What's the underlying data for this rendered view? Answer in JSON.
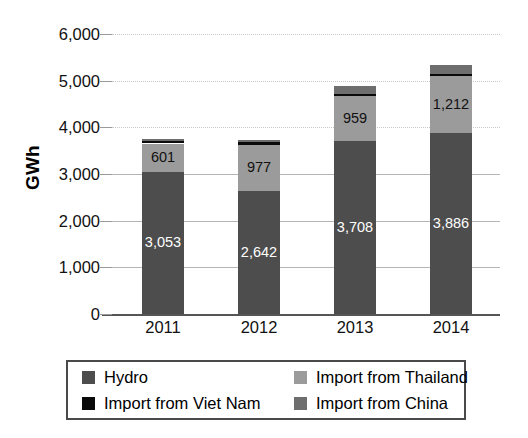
{
  "chart_data": {
    "type": "bar",
    "subtype": "stacked-column",
    "title": "",
    "xlabel": "",
    "ylabel": "GWh",
    "ylim": [
      0,
      6000
    ],
    "ytick_step": 1000,
    "ytick_labels": [
      "6,000",
      "5,000",
      "4,000",
      "3,000",
      "2,000",
      "1,000",
      "0"
    ],
    "ytick_values": [
      6000,
      5000,
      4000,
      3000,
      2000,
      1000,
      0
    ],
    "grid": true,
    "legend_position": "bottom",
    "categories": [
      "2011",
      "2012",
      "2013",
      "2014"
    ],
    "series": [
      {
        "name": "Hydro",
        "color": "#4d4d4d",
        "values": [
          3053,
          2642,
          3708,
          3886
        ],
        "labels": [
          "3,053",
          "2,642",
          "3,708",
          "3,886"
        ]
      },
      {
        "name": "Import from Thailand",
        "color": "#9b9b9b",
        "values": [
          601,
          977,
          959,
          1212
        ],
        "labels": [
          "601",
          "977",
          "959",
          "1,212"
        ]
      },
      {
        "name": "Import from Viet Nam",
        "color": "#0a0a0a",
        "values": [
          60,
          60,
          55,
          55
        ],
        "labels": [
          "",
          "",
          "",
          ""
        ]
      },
      {
        "name": "Import from China",
        "color": "#6e6e6e",
        "values": [
          45,
          60,
          170,
          180
        ],
        "labels": [
          "",
          "",
          "",
          ""
        ]
      }
    ],
    "totals": [
      3759,
      3739,
      4892,
      5333
    ]
  },
  "legend": {
    "items": [
      {
        "label": "Hydro",
        "color": "#4d4d4d",
        "swatch": "hydro"
      },
      {
        "label": "Import from Thailand",
        "color": "#9b9b9b",
        "swatch": "thailand"
      },
      {
        "label": "Import from Viet Nam",
        "color": "#0a0a0a",
        "swatch": "vietnam"
      },
      {
        "label": "Import from China",
        "color": "#6e6e6e",
        "swatch": "china"
      }
    ]
  },
  "axis": {
    "y_title": "GWh"
  }
}
